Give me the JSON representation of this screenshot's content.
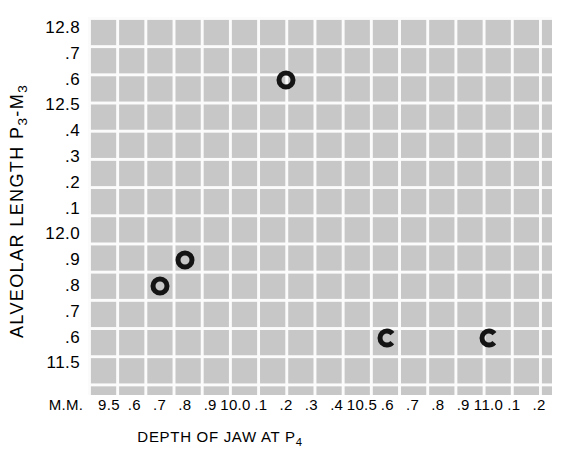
{
  "colors": {
    "page_background": "#ffffff",
    "grid_fill": "#c7c7c7",
    "grid_line": "#fbfbfb",
    "marker_color": "#141414",
    "text_color": "#000000"
  },
  "chart_data": {
    "type": "scatter",
    "title": "",
    "xlabel": "DEPTH OF JAW AT P4",
    "ylabel": "ALVEOLAR LENGTH P3-M3",
    "xlabel_parts": [
      {
        "t": "DEPTH OF JAW AT P"
      },
      {
        "t": "4",
        "sub": true
      }
    ],
    "ylabel_parts": [
      {
        "t": "ALVEOLAR LENGTH P"
      },
      {
        "t": "3",
        "sub": true
      },
      {
        "t": "-M"
      },
      {
        "t": "3",
        "sub": true
      }
    ],
    "x_unit_label": "M.M.",
    "grid": "on",
    "x_range": [
      9.5,
      11.2
    ],
    "y_range": [
      11.5,
      12.8
    ],
    "x_axis_ticks": [
      {
        "label": "9.5",
        "value": 9.5
      },
      {
        "label": ".6",
        "value": 9.6
      },
      {
        "label": ".7",
        "value": 9.7
      },
      {
        "label": ".8",
        "value": 9.8
      },
      {
        "label": ".9",
        "value": 9.9
      },
      {
        "label": "10.0",
        "value": 10.0
      },
      {
        "label": ".1",
        "value": 10.1
      },
      {
        "label": ".2",
        "value": 10.2
      },
      {
        "label": ".3",
        "value": 10.3
      },
      {
        "label": ".4",
        "value": 10.4
      },
      {
        "label": "10.5",
        "value": 10.5
      },
      {
        "label": ".6",
        "value": 10.6
      },
      {
        "label": ".7",
        "value": 10.7
      },
      {
        "label": ".8",
        "value": 10.8
      },
      {
        "label": ".9",
        "value": 10.9
      },
      {
        "label": "11.0",
        "value": 11.0
      },
      {
        "label": ".1",
        "value": 11.1
      },
      {
        "label": ".2",
        "value": 11.2
      }
    ],
    "y_axis_ticks": [
      {
        "label": "12.8",
        "value": 12.8
      },
      {
        "label": ".7",
        "value": 12.7
      },
      {
        "label": ".6",
        "value": 12.6
      },
      {
        "label": "12.5",
        "value": 12.5
      },
      {
        "label": ".4",
        "value": 12.4
      },
      {
        "label": ".3",
        "value": 12.3
      },
      {
        "label": ".2",
        "value": 12.2
      },
      {
        "label": ".1",
        "value": 12.1
      },
      {
        "label": "12.0",
        "value": 12.0
      },
      {
        "label": ".9",
        "value": 11.9
      },
      {
        "label": ".8",
        "value": 11.8
      },
      {
        "label": ".7",
        "value": 11.7
      },
      {
        "label": ".6",
        "value": 11.6
      },
      {
        "label": "11.5",
        "value": 11.5
      }
    ],
    "points": [
      {
        "x": 10.2,
        "y": 12.6,
        "marker": "open-circle"
      },
      {
        "x": 9.8,
        "y": 11.9,
        "marker": "open-circle"
      },
      {
        "x": 9.7,
        "y": 11.8,
        "marker": "open-circle"
      },
      {
        "x": 10.6,
        "y": 11.6,
        "marker": "open-c"
      },
      {
        "x": 11.0,
        "y": 11.6,
        "marker": "open-c"
      }
    ]
  }
}
